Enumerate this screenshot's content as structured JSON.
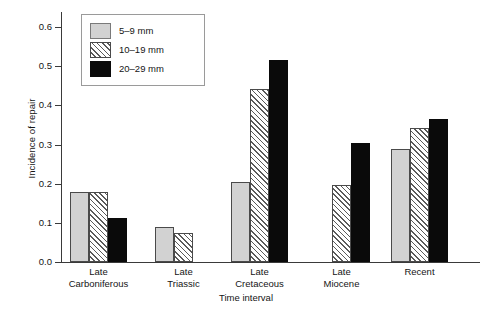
{
  "chart_data": {
    "type": "bar",
    "title": "",
    "xlabel": "Time interval",
    "ylabel": "Incidence of repair",
    "ylim": [
      0.0,
      0.6
    ],
    "yticks": [
      "0.0",
      "0.1",
      "0.2",
      "0.3",
      "0.4",
      "0.5",
      "0.6"
    ],
    "grid": false,
    "legend_position": "upper-left-inside",
    "categories": [
      "Late Carboniferous",
      "Late Triassic",
      "Late Cretaceous",
      "Late Miocene",
      "Recent"
    ],
    "category_lines": [
      [
        "Late",
        "Carboniferous"
      ],
      [
        "Late",
        "Triassic"
      ],
      [
        "Late",
        "Cretaceous"
      ],
      [
        "Late",
        "Miocene"
      ],
      [
        "Recent",
        ""
      ]
    ],
    "series": [
      {
        "name": "5–9 mm",
        "style": "solid-gray",
        "color": "#d2d2d2",
        "values": [
          0.178,
          0.09,
          0.205,
          null,
          0.288
        ]
      },
      {
        "name": "10–19 mm",
        "style": "hatch",
        "color": "#ffffff",
        "values": [
          0.178,
          0.074,
          0.443,
          0.196,
          0.343
        ]
      },
      {
        "name": "20–29 mm",
        "style": "black",
        "color": "#0a0a0a",
        "values": [
          0.112,
          null,
          0.517,
          0.304,
          0.366
        ]
      }
    ]
  },
  "legend": {
    "items": [
      {
        "label": "5–9 mm",
        "style": "solid-gray"
      },
      {
        "label": "10–19 mm",
        "style": "hatch"
      },
      {
        "label": "20–29 mm",
        "style": "black"
      }
    ]
  },
  "axes": {
    "y_title": "Incidence of repair",
    "x_title": "Time interval",
    "y_tick_labels": [
      "0.6",
      "0.5",
      "0.4",
      "0.3",
      "0.2",
      "0.1",
      "0.0"
    ]
  }
}
